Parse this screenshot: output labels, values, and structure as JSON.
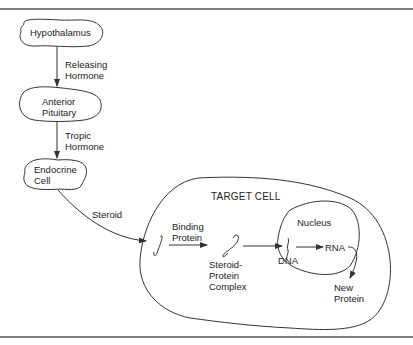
{
  "diagram": {
    "nodes": {
      "hypothalamus": "Hypothalamus",
      "anterior_pituitary": "Anterior\nPituitary",
      "endocrine_cell": "Endocrine\nCell",
      "target_cell": "TARGET CELL",
      "nucleus": "Nucleus"
    },
    "edges": {
      "releasing_hormone": "Releasing\nHormone",
      "tropic_hormone": "Tropic\nHormone",
      "steroid": "Steroid"
    },
    "labels": {
      "binding_protein": "Binding\nProtein",
      "steroid_protein_complex": "Steroid-\nProtein\nComplex",
      "dna": "DNA",
      "rna": "RNA",
      "new_protein": "New\nProtein"
    },
    "colors": {
      "line": "#333333",
      "rule": "#555555",
      "background": "#ffffff"
    }
  }
}
